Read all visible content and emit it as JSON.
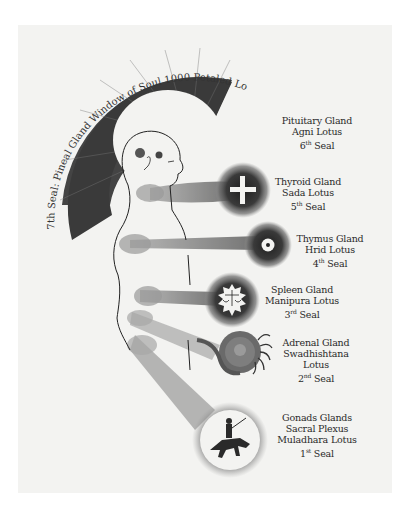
{
  "illustration": {
    "title": "Seven Seals and Endocrine Glands",
    "crown_arc_text": "7th Seal: Pineal Gland Window of Soul 1000 Petaled Lotus",
    "colors": {
      "paper": "#f3f3f1",
      "ink": "#2a2a2a",
      "rays": "#555555",
      "halo": "#6b6b6b"
    }
  },
  "seals": [
    {
      "lines": [
        "Pituitary Gland",
        "Agni Lotus"
      ],
      "seal_num": "6",
      "seal_sup": "th",
      "seal_word": "Seal",
      "symbol": "none"
    },
    {
      "lines": [
        "Thyroid Gland",
        "Sada Lotus"
      ],
      "seal_num": "5",
      "seal_sup": "th",
      "seal_word": "Seal",
      "symbol": "cross-icon"
    },
    {
      "lines": [
        "Thymus Gland",
        "Hrid Lotus"
      ],
      "seal_num": "4",
      "seal_sup": "th",
      "seal_word": "Seal",
      "symbol": "dot-circle-icon"
    },
    {
      "lines": [
        "Spleen Gland",
        "Manipura Lotus"
      ],
      "seal_num": "3",
      "seal_sup": "rd",
      "seal_word": "Seal",
      "symbol": "scales-icon"
    },
    {
      "lines": [
        "Adrenal Gland",
        "Swadhishtana",
        "Lotus"
      ],
      "seal_num": "2",
      "seal_sup": "nd",
      "seal_word": "Seal",
      "symbol": "serpent-icon"
    },
    {
      "lines": [
        "Gonads Glands",
        "Sacral Plexus",
        "Muladhara Lotus"
      ],
      "seal_num": "1",
      "seal_sup": "st",
      "seal_word": "Seal",
      "symbol": "horseman-icon"
    }
  ]
}
